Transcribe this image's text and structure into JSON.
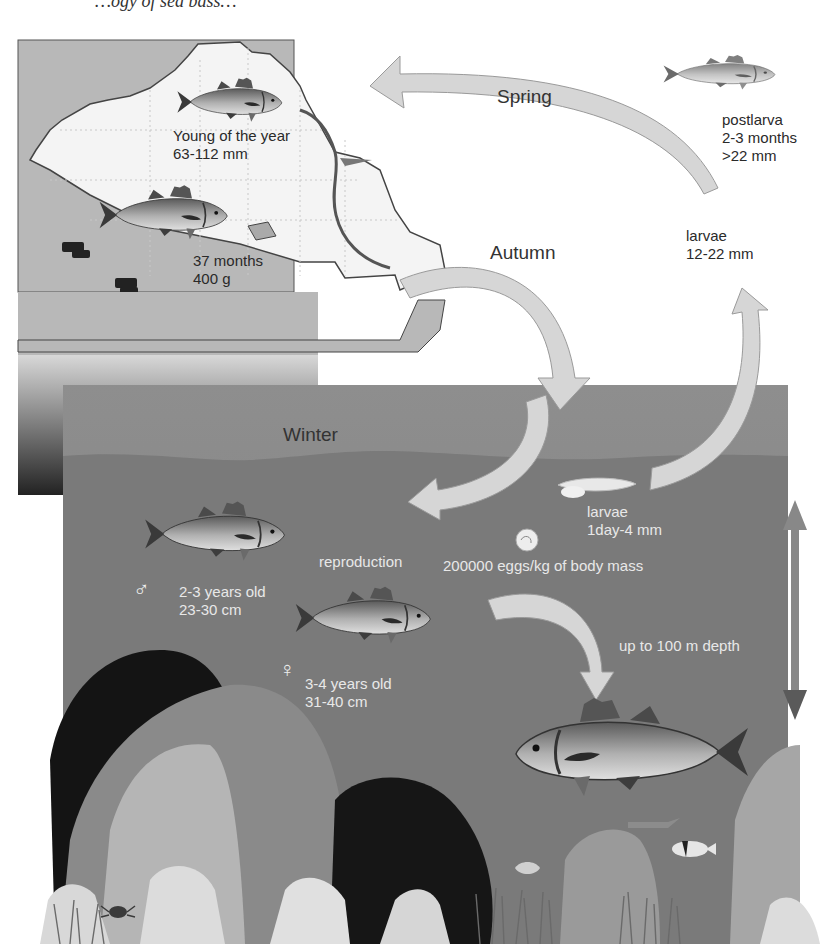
{
  "caption": {
    "text": "…ogy of sea bass…"
  },
  "seasons": {
    "spring": "Spring",
    "autumn": "Autumn",
    "winter": "Winter"
  },
  "stages": {
    "young_of_year": {
      "line1": "Young of the year",
      "line2": "63-112 mm"
    },
    "juvenile": {
      "line1": "37 months",
      "line2": "400 g"
    },
    "postlarva": {
      "line1": "postlarva",
      "line2": "2-3 months",
      "line3": ">22 mm"
    },
    "larvae_late": {
      "line1": "larvae",
      "line2": "12-22 mm"
    },
    "larvae_early": {
      "line1": "larvae",
      "line2": "1day-4 mm"
    },
    "eggs": {
      "text": "200000 eggs/kg of body mass"
    },
    "reproduction": {
      "text": "reproduction"
    },
    "male": {
      "symbol": "♂",
      "line1": "2-3 years old",
      "line2": "23-30 cm"
    },
    "female": {
      "symbol": "♀",
      "line1": "3-4 years old",
      "line2": "31-40 cm"
    },
    "depth": {
      "text": "up to 100 m depth"
    }
  },
  "icons": {
    "fish": "fish-icon",
    "larva": "larva-icon",
    "egg": "egg-icon",
    "arrow": "cycle-arrow-icon",
    "depth_arrow": "double-arrow-icon",
    "rock": "rock-icon",
    "crab": "crab-icon"
  },
  "colors": {
    "land": "#b8b8b8",
    "lagoon": "#f4f4f4",
    "sea_surface": "#8a8a8a",
    "sea_deep": "#6e6e6e",
    "arrow": "#d6d6d6",
    "rock_dark": "#1a1a1a",
    "rock_mid": "#8d8d8d",
    "rock_light": "#c4c4c4"
  }
}
